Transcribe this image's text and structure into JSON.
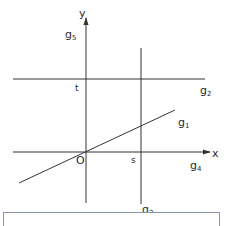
{
  "diagram": {
    "axes": {
      "x_label": "x",
      "y_label": "y",
      "origin_label": "O"
    },
    "lines": [
      {
        "id": "g1",
        "name": "g",
        "sub": "1",
        "description": "line through origin with positive slope"
      },
      {
        "id": "g2",
        "name": "g",
        "sub": "2",
        "description": "horizontal line y = t"
      },
      {
        "id": "g3",
        "name": "g",
        "sub": "3",
        "description": "vertical line x = s"
      },
      {
        "id": "g4",
        "name": "g",
        "sub": "4",
        "description": "x-axis"
      },
      {
        "id": "g5",
        "name": "g",
        "sub": "5",
        "description": "y-axis"
      }
    ],
    "points": {
      "s_label": "s",
      "t_label": "t"
    },
    "colors": {
      "line": "#333333",
      "caption_border": "#8a97a8"
    }
  },
  "caption": {
    "text": ""
  }
}
